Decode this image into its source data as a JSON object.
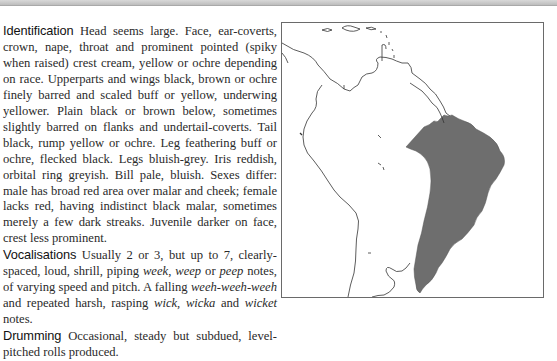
{
  "sections": [
    {
      "heading": "Identification",
      "segments": [
        {
          "text": " Head seems large. Face, ear-coverts, crown, nape, throat and prominent pointed (spiky when raised) crest cream, yellow or ochre depending on race. Upperparts and wings black, brown or ochre finely barred and scaled buff or yellow, underwing yellower. Plain black or brown below, sometimes slightly barred on flanks and undertail-coverts. Tail black, rump yellow or ochre. Leg feathering buff or ochre, flecked black. Legs bluish-grey. Iris reddish, orbital ring greyish. Bill pale, bluish. Sexes differ: male has broad red area over malar and cheek; female lacks red, having indistinct black malar, sometimes merely a few dark streaks. Juvenile darker on face, crest less prominent."
        }
      ]
    },
    {
      "heading": "Vocalisations",
      "segments": [
        {
          "text": " Usually 2 or 3, but up to 7, clearly-spaced, loud, shrill, piping "
        },
        {
          "text": "week",
          "italic": true
        },
        {
          "text": ", "
        },
        {
          "text": "weep",
          "italic": true
        },
        {
          "text": " or "
        },
        {
          "text": "peep",
          "italic": true
        },
        {
          "text": " notes, of varying speed and pitch. A falling "
        },
        {
          "text": "weeh-weeh-weeh",
          "italic": true
        },
        {
          "text": " and repeated harsh, rasping "
        },
        {
          "text": "wick",
          "italic": true
        },
        {
          "text": ", "
        },
        {
          "text": "wicka",
          "italic": true
        },
        {
          "text": " and "
        },
        {
          "text": "wicket",
          "italic": true
        },
        {
          "text": " notes."
        }
      ]
    },
    {
      "heading": "Drumming",
      "segments": [
        {
          "text": " Occasional, steady but subdued, level-pitched rolls produced."
        }
      ]
    }
  ],
  "map": {
    "region": "Central and South America",
    "range_fill": "#6e6e6e",
    "coast_color": "#333333",
    "frame_color": "#6a6a6a"
  }
}
